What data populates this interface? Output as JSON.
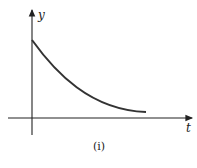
{
  "figure": {
    "caption": "(i)",
    "x_axis_label": "t",
    "y_axis_label": "y",
    "curve": "decaying curve from positive y-intercept approaching t-axis"
  },
  "colors": {
    "axis": "#222222",
    "curve": "#333333",
    "background": "#ffffff"
  }
}
